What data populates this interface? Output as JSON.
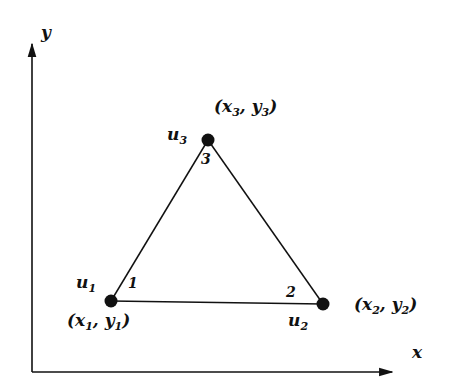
{
  "diagram": {
    "type": "triangular-element",
    "colors": {
      "ink": "#111111",
      "background": "#ffffff"
    },
    "axes": {
      "x_label": "x",
      "y_label": "y",
      "origin": [
        32,
        372
      ],
      "x_end": [
        394,
        372
      ],
      "y_end": [
        32,
        42
      ]
    },
    "nodes": [
      {
        "id": 1,
        "pos": [
          111,
          301
        ],
        "u_base": "u",
        "u_sub": "1",
        "coord_text": "(x",
        "coord_sub_x": "1",
        "coord_mid": ", y",
        "coord_sub_y": "1",
        "coord_close": ")",
        "local_index": "1"
      },
      {
        "id": 2,
        "pos": [
          323,
          304
        ],
        "u_base": "u",
        "u_sub": "2",
        "coord_text": "(x",
        "coord_sub_x": "2",
        "coord_mid": ", y",
        "coord_sub_y": "2",
        "coord_close": ")",
        "local_index": "2"
      },
      {
        "id": 3,
        "pos": [
          208,
          140
        ],
        "u_base": "u",
        "u_sub": "3",
        "coord_text": "(x",
        "coord_sub_x": "3",
        "coord_mid": ", y",
        "coord_sub_y": "3",
        "coord_close": ")",
        "local_index": "3"
      }
    ],
    "edges": [
      [
        1,
        2
      ],
      [
        2,
        3
      ],
      [
        3,
        1
      ]
    ]
  }
}
